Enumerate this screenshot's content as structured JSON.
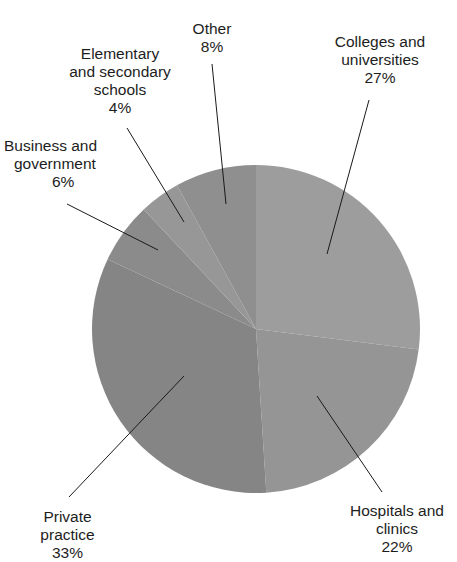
{
  "chart_data": {
    "type": "pie",
    "title": "",
    "start_angle_deg": 0,
    "direction": "clockwise",
    "slices": [
      {
        "label": "Colleges and universities",
        "value": 27,
        "display": "27%",
        "color": "#9d9d9d"
      },
      {
        "label": "Hospitals and clinics",
        "value": 22,
        "display": "22%",
        "color": "#959595"
      },
      {
        "label": "Private practice",
        "value": 33,
        "display": "33%",
        "color": "#858585"
      },
      {
        "label": "Business and government",
        "value": 6,
        "display": "6%",
        "color": "#8b8b8b"
      },
      {
        "label": "Elementary and secondary schools",
        "value": 4,
        "display": "4%",
        "color": "#979797"
      },
      {
        "label": "Other",
        "value": 8,
        "display": "8%",
        "color": "#8f8f8f"
      }
    ]
  },
  "labels": {
    "colleges": {
      "line1": "Colleges and",
      "line2": "universities",
      "pct": "27%"
    },
    "hospitals": {
      "line1": "Hospitals and",
      "line2": "clinics",
      "pct": "22%"
    },
    "private": {
      "line1": "Private",
      "line2": "practice",
      "pct": "33%"
    },
    "business": {
      "line1": "Business and",
      "line2": "government",
      "pct": "6%"
    },
    "elementary": {
      "line1": "Elementary",
      "line2": "and secondary",
      "line3": "schools",
      "pct": "4%"
    },
    "other": {
      "line1": "Other",
      "pct": "8%"
    }
  }
}
